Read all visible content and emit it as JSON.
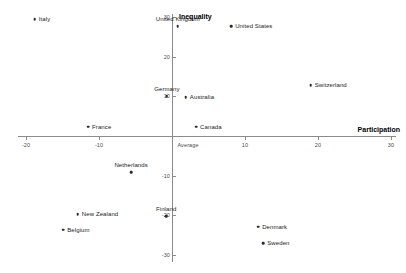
{
  "chart_data": {
    "type": "scatter",
    "title": "",
    "xlabel": "Participation",
    "ylabel": "Inequality",
    "xlim": [
      -22,
      30
    ],
    "ylim": [
      -31,
      31
    ],
    "grid": false,
    "legend": "none",
    "origin_tick_label": "Average",
    "xticks": [
      {
        "value": -20,
        "label": "-20"
      },
      {
        "value": -10,
        "label": "-10"
      },
      {
        "value": 0,
        "label": "Average"
      },
      {
        "value": 10,
        "label": "10"
      },
      {
        "value": 20,
        "label": "20"
      },
      {
        "value": 30,
        "label": "30"
      }
    ],
    "yticks": [
      {
        "value": 30,
        "label": "30"
      },
      {
        "value": 20,
        "label": "20"
      },
      {
        "value": 10,
        "label": "10"
      },
      {
        "value": -10,
        "label": "-10"
      },
      {
        "value": -20,
        "label": "-20"
      },
      {
        "value": -30,
        "label": "-30"
      }
    ],
    "points": [
      {
        "label": "Italy",
        "x": -18.8,
        "y": 29.5,
        "label_pos": "right"
      },
      {
        "label": "United Kingdom",
        "x": 0.8,
        "y": 27.8,
        "label_pos": "above"
      },
      {
        "label": "United States",
        "x": 8.1,
        "y": 27.8,
        "label_pos": "right"
      },
      {
        "label": "Switzerland",
        "x": 19.0,
        "y": 12.9,
        "label_pos": "right"
      },
      {
        "label": "Germany",
        "x": -0.7,
        "y": 10.1,
        "label_pos": "above"
      },
      {
        "label": "Australia",
        "x": 1.9,
        "y": 9.8,
        "label_pos": "right"
      },
      {
        "label": "France",
        "x": -11.5,
        "y": 2.3,
        "label_pos": "right"
      },
      {
        "label": "Canada",
        "x": 3.3,
        "y": 2.3,
        "label_pos": "right"
      },
      {
        "label": "Netherlands",
        "x": -5.6,
        "y": -9.1,
        "label_pos": "above"
      },
      {
        "label": "New Zealand",
        "x": -12.9,
        "y": -19.7,
        "label_pos": "right"
      },
      {
        "label": "Finland",
        "x": -0.8,
        "y": -20.2,
        "label_pos": "above"
      },
      {
        "label": "Belgium",
        "x": -14.9,
        "y": -23.7,
        "label_pos": "right"
      },
      {
        "label": "Denmark",
        "x": 11.8,
        "y": -22.9,
        "label_pos": "right"
      },
      {
        "label": "Sweden",
        "x": 12.5,
        "y": -27.0,
        "label_pos": "right"
      }
    ]
  },
  "colors": {
    "marker": "#2b2b2b",
    "axis": "#8a8a8a",
    "text": "#1a1a1a",
    "tick_text": "#4a4a4a",
    "background": "#ffffff"
  }
}
